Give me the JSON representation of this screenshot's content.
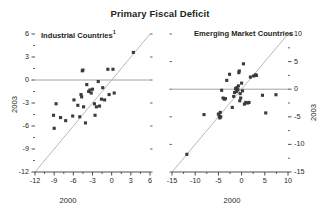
{
  "title": "Primary Fiscal Deficit",
  "chart_data": [
    {
      "type": "scatter",
      "title": "Industrial Countries",
      "title_footnote": "1",
      "panel": "left",
      "xlabel": "2000",
      "ylabel": "2003",
      "xlim": [
        -12,
        6
      ],
      "ylim": [
        -12,
        6
      ],
      "xticks": [
        "-12",
        "-9",
        "-6",
        "-3",
        "0",
        "3",
        "6"
      ],
      "xtickvals": [
        -12,
        -9,
        -6,
        -3,
        0,
        3,
        6
      ],
      "yticks": [
        "6",
        "3",
        "0",
        "-3",
        "-6",
        "-9",
        "-12"
      ],
      "ytickvals": [
        6,
        3,
        0,
        -3,
        -6,
        -9,
        -12
      ],
      "yaxis_side": "left",
      "grid": false,
      "legend": "none",
      "zero_line": true,
      "diagonal_line": true,
      "points": [
        [
          -9.0,
          -6.3
        ],
        [
          -9.1,
          -4.6
        ],
        [
          -8.7,
          -3.1
        ],
        [
          -8.0,
          -4.9
        ],
        [
          -7.2,
          -5.3
        ],
        [
          -6.1,
          -4.7
        ],
        [
          -5.9,
          -2.6
        ],
        [
          -5.3,
          -3.3
        ],
        [
          -5.0,
          -4.8
        ],
        [
          -4.8,
          -1.9
        ],
        [
          -4.7,
          -2.2
        ],
        [
          -4.6,
          1.2
        ],
        [
          -4.5,
          1.3
        ],
        [
          -4.4,
          -3.5
        ],
        [
          -4.1,
          -5.6
        ],
        [
          -3.9,
          -0.6
        ],
        [
          -3.6,
          -1.5
        ],
        [
          -3.4,
          -1.3
        ],
        [
          -3.2,
          -1.7
        ],
        [
          -3.0,
          -1.2
        ],
        [
          -2.7,
          -3.1
        ],
        [
          -2.6,
          -4.6
        ],
        [
          -2.4,
          -3.5
        ],
        [
          -2.1,
          -0.2
        ],
        [
          -1.9,
          -3.4
        ],
        [
          -1.6,
          -2.5
        ],
        [
          -1.4,
          -1.0
        ],
        [
          -1.1,
          -2.6
        ],
        [
          -0.6,
          1.4
        ],
        [
          -0.4,
          -1.9
        ],
        [
          0.2,
          1.4
        ],
        [
          0.4,
          -1.7
        ],
        [
          3.4,
          3.6
        ]
      ]
    },
    {
      "type": "scatter",
      "title": "Emerging Market Countries",
      "panel": "right",
      "xlabel": "2000",
      "ylabel": "2003",
      "xlim": [
        -15,
        10
      ],
      "ylim": [
        -15,
        10
      ],
      "xticks": [
        "-15",
        "-10",
        "-5",
        "0",
        "5",
        "10"
      ],
      "xtickvals": [
        -15,
        -10,
        -5,
        0,
        5,
        10
      ],
      "yticks": [
        "10",
        "5",
        "0",
        "-5",
        "-10",
        "-15"
      ],
      "ytickvals": [
        10,
        5,
        0,
        -5,
        -10,
        -15
      ],
      "yaxis_side": "right",
      "grid": false,
      "legend": "none",
      "zero_line": true,
      "diagonal_line": true,
      "points": [
        [
          -11.8,
          -11.8
        ],
        [
          -8.1,
          -4.6
        ],
        [
          -5.0,
          -4.5
        ],
        [
          -4.8,
          -4.9
        ],
        [
          -4.7,
          -5.2
        ],
        [
          -4.6,
          -4.2
        ],
        [
          -4.5,
          -5.0
        ],
        [
          -4.3,
          -0.2
        ],
        [
          -4.0,
          -1.6
        ],
        [
          -3.7,
          -1.8
        ],
        [
          -3.5,
          -1.7
        ],
        [
          -3.2,
          1.6
        ],
        [
          -2.6,
          2.7
        ],
        [
          -2.0,
          -3.3
        ],
        [
          -1.7,
          -1.3
        ],
        [
          -1.5,
          -0.6
        ],
        [
          -1.3,
          0.1
        ],
        [
          -1.1,
          -0.4
        ],
        [
          -1.0,
          0.3
        ],
        [
          -0.8,
          -0.1
        ],
        [
          -0.7,
          0.6
        ],
        [
          -0.6,
          3.0
        ],
        [
          -0.5,
          3.3
        ],
        [
          -0.4,
          -2.1
        ],
        [
          -0.3,
          -0.8
        ],
        [
          -0.2,
          -1.6
        ],
        [
          0.0,
          1.1
        ],
        [
          0.2,
          -0.3
        ],
        [
          0.4,
          4.6
        ],
        [
          0.6,
          -2.7
        ],
        [
          0.9,
          -2.4
        ],
        [
          1.3,
          -2.5
        ],
        [
          1.6,
          -2.4
        ],
        [
          1.9,
          2.2
        ],
        [
          2.6,
          2.4
        ],
        [
          3.0,
          2.6
        ],
        [
          3.2,
          2.5
        ],
        [
          4.5,
          -1.1
        ],
        [
          5.2,
          -4.3
        ],
        [
          7.4,
          -1.0
        ]
      ]
    }
  ]
}
